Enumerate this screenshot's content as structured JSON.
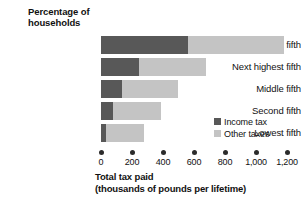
{
  "title": "Percentage of\nhouseholds",
  "title_line1": "Percentage of",
  "title_line2": "households",
  "legend": {
    "position": "inside-right",
    "items": [
      {
        "label": "Income tax",
        "color": "#585858",
        "key": "income_tax"
      },
      {
        "label": "Other taxes",
        "color": "#c4c4c4",
        "key": "other_taxes"
      }
    ]
  },
  "axis": {
    "x_caption_line1": "Total tax paid",
    "x_caption_line2": "(thousands of pounds per lifetime)",
    "tick_labels": [
      "0",
      "200",
      "400",
      "600",
      "800",
      "1,000",
      "1,200"
    ]
  },
  "chart_data": {
    "type": "bar",
    "orientation": "horizontal",
    "stacked": true,
    "title": "Percentage of households",
    "xlabel": "Total tax paid (thousands of pounds per lifetime)",
    "ylabel": "Percentage of households",
    "xlim": [
      0,
      1200
    ],
    "xticks": [
      0,
      200,
      400,
      600,
      800,
      1000,
      1200
    ],
    "xtick_labels": [
      "0",
      "200",
      "400",
      "600",
      "800",
      "1,000",
      "1,200"
    ],
    "grid": false,
    "legend_position": "inside-right",
    "categories": [
      "Highest fifth",
      "Next highest fifth",
      "Middle fifth",
      "Second fifth",
      "Lowest fifth"
    ],
    "series": [
      {
        "name": "Income tax",
        "color": "#585858",
        "values": [
          560,
          245,
          135,
          80,
          30
        ]
      },
      {
        "name": "Other taxes",
        "color": "#c4c4c4",
        "values": [
          620,
          435,
          365,
          310,
          250
        ]
      }
    ],
    "totals": [
      1180,
      680,
      500,
      390,
      280
    ],
    "units": "thousands of pounds per lifetime"
  }
}
